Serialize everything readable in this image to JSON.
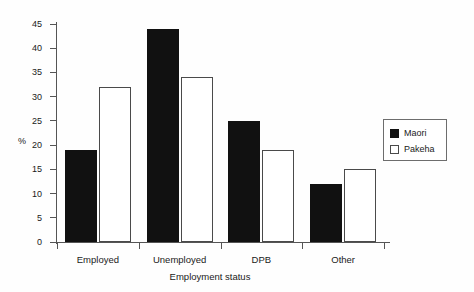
{
  "chart_data": {
    "type": "bar",
    "title": "",
    "xlabel": "Employment status",
    "ylabel": "%",
    "categories": [
      "Employed",
      "Unemployed",
      "DPB",
      "Other"
    ],
    "series": [
      {
        "name": "Maori",
        "values": [
          19,
          44,
          25,
          12
        ],
        "color": "#111111",
        "style": "filled"
      },
      {
        "name": "Pakeha",
        "values": [
          32,
          34,
          19,
          15
        ],
        "color": "#ffffff",
        "style": "hollow"
      }
    ],
    "ylim": [
      0,
      45
    ],
    "yticks": [
      0,
      5,
      10,
      15,
      20,
      25,
      30,
      35,
      40,
      45
    ],
    "ytick_labels": [
      "0",
      "5",
      "10",
      "15",
      "20",
      "25",
      "30",
      "35",
      "40",
      "45"
    ],
    "grid": false,
    "legend_position": "right"
  },
  "legend": {
    "entries": [
      {
        "label": "Maori"
      },
      {
        "label": "Pakeha"
      }
    ]
  }
}
